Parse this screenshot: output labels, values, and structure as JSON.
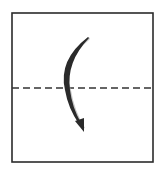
{
  "diagram": {
    "type": "origami-fold-step",
    "fold_type": "valley-fold",
    "colors": {
      "background": "#ffffff",
      "paper_outline": "#2b2b2b",
      "fold_line": "#333333",
      "arrow": "#2a2a2a",
      "arrow_shadow": "#a8a8a8"
    },
    "paper": {
      "x": 12,
      "y": 13,
      "width": 141,
      "height": 149
    },
    "fold_line": {
      "y": 88,
      "x1": 12,
      "x2": 153,
      "style": "dashed",
      "dash": "7 4"
    },
    "arrow": {
      "direction": "down",
      "start": [
        88,
        37
      ],
      "control": [
        58,
        80
      ],
      "end": [
        83,
        131
      ]
    }
  }
}
